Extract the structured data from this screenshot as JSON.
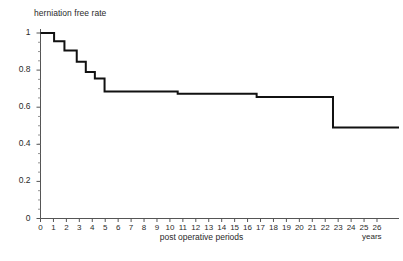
{
  "chart_data": {
    "type": "line",
    "subtype": "kaplan-meier-step",
    "title": "",
    "ylabel": "herniation free rate",
    "xlabel": "post operative periods",
    "x_unit_label": "years",
    "xlim": [
      0,
      27.7
    ],
    "ylim": [
      0,
      1.06
    ],
    "xticks": [
      0,
      1,
      2,
      3,
      4,
      5,
      6,
      7,
      8,
      9,
      10,
      11,
      12,
      13,
      14,
      15,
      16,
      17,
      18,
      19,
      20,
      21,
      22,
      23,
      24,
      25,
      26
    ],
    "xtick_labels": [
      "0",
      "1",
      "2",
      "3",
      "4",
      "5",
      "6",
      "7",
      "8",
      "9",
      "10",
      "11",
      "12",
      "13",
      "14",
      "15",
      "16",
      "17",
      "18",
      "19",
      "20",
      "21",
      "22",
      "23",
      "24",
      "25",
      "26"
    ],
    "yticks": [
      0,
      0.2,
      0.4,
      0.6,
      0.8,
      1
    ],
    "ytick_labels": [
      "0",
      "0.2",
      "0.4",
      "0.6",
      "0.8",
      "1"
    ],
    "grid": false,
    "legend": null,
    "legend_position": "none",
    "line_color": "#111111",
    "line_width": 2,
    "axis_color": "#555555",
    "series": [
      {
        "name": "herniation free rate",
        "x": [
          0,
          1.05,
          1.05,
          1.85,
          1.85,
          2.8,
          2.8,
          3.5,
          3.5,
          4.2,
          4.2,
          4.95,
          4.95,
          10.6,
          10.6,
          16.7,
          16.7,
          22.6,
          22.6,
          27.7
        ],
        "y": [
          1.0,
          1.0,
          0.955,
          0.955,
          0.905,
          0.905,
          0.845,
          0.845,
          0.79,
          0.79,
          0.755,
          0.755,
          0.685,
          0.685,
          0.672,
          0.672,
          0.655,
          0.655,
          0.49,
          0.49
        ]
      }
    ],
    "step_events": [
      {
        "year": 0.0,
        "rate": 1.0
      },
      {
        "year": 1.05,
        "rate": 0.955
      },
      {
        "year": 1.85,
        "rate": 0.905
      },
      {
        "year": 2.8,
        "rate": 0.845
      },
      {
        "year": 3.5,
        "rate": 0.79
      },
      {
        "year": 4.2,
        "rate": 0.755
      },
      {
        "year": 4.95,
        "rate": 0.685
      },
      {
        "year": 10.6,
        "rate": 0.672
      },
      {
        "year": 16.7,
        "rate": 0.655
      },
      {
        "year": 22.6,
        "rate": 0.49
      }
    ]
  }
}
